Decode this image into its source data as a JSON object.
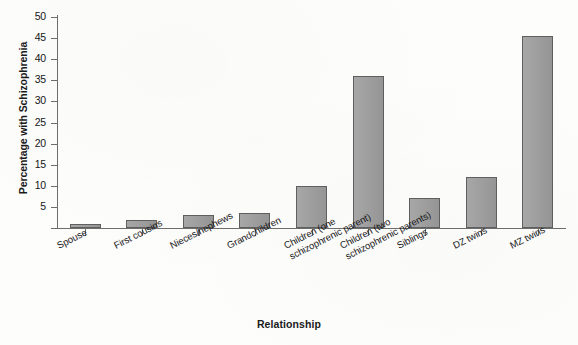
{
  "chart_data": {
    "type": "bar",
    "title": "",
    "xlabel": "Relationship",
    "ylabel": "Percentage with Schizophrenia",
    "ylim": [
      0,
      50
    ],
    "yticks": [
      0,
      5,
      10,
      15,
      20,
      25,
      30,
      35,
      40,
      45,
      50
    ],
    "ytick_labels": [
      "",
      "5",
      "10",
      "15",
      "20",
      "25",
      "30",
      "35",
      "40",
      "45",
      "50"
    ],
    "grid": false,
    "legend": null,
    "bar_color": "#9d9d9d",
    "bar_edge_color": "#5f5f5f",
    "categories": [
      "Spouse",
      "First cousins",
      "Nieces/nephews",
      "Grandchildren",
      "Children (one\nschizophrenic parent)",
      "Children (two\nschizophrenic parents)",
      "Siblings",
      "DZ twins",
      "MZ twins"
    ],
    "values": [
      1,
      2,
      3,
      3.5,
      10,
      36,
      7,
      12,
      45.5
    ]
  },
  "axes": {
    "y_title": "Percentage with Schizophrenia",
    "x_title": "Relationship"
  }
}
